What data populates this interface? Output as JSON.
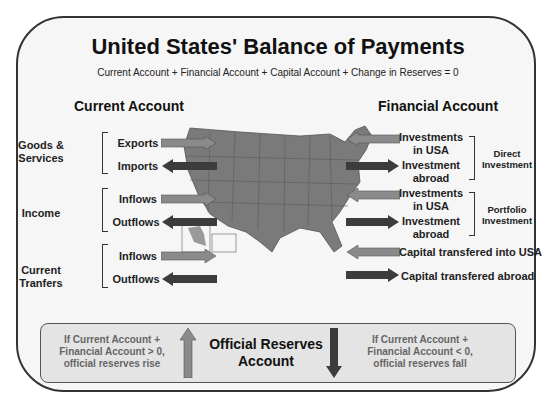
{
  "title": "United States' Balance of Payments",
  "subtitle": "Current Account + Financial Account + Capital Account + Change in Reserves = 0",
  "current_account": {
    "heading": "Current Account",
    "groups": [
      {
        "label_line1": "Goods &",
        "label_line2": "Services",
        "items": [
          {
            "label": "Exports",
            "direction": "in"
          },
          {
            "label": "Imports",
            "direction": "out"
          }
        ]
      },
      {
        "label_line1": "Income",
        "label_line2": "",
        "items": [
          {
            "label": "Inflows",
            "direction": "in"
          },
          {
            "label": "Outflows",
            "direction": "out"
          }
        ]
      },
      {
        "label_line1": "Current",
        "label_line2": "Tranfers",
        "items": [
          {
            "label": "Inflows",
            "direction": "in"
          },
          {
            "label": "Outflows",
            "direction": "out"
          }
        ]
      }
    ]
  },
  "financial_account": {
    "heading": "Financial Account",
    "groups": [
      {
        "label_line1": "Direct",
        "label_line2": "Investment",
        "items": [
          {
            "line1": "Investments",
            "line2": "in USA",
            "direction": "in"
          },
          {
            "line1": "Investment",
            "line2": "abroad",
            "direction": "out"
          }
        ]
      },
      {
        "label_line1": "Portfolio",
        "label_line2": "Investment",
        "items": [
          {
            "line1": "Investments",
            "line2": "in USA",
            "direction": "in"
          },
          {
            "line1": "Investment",
            "line2": "abroad",
            "direction": "out"
          }
        ]
      }
    ],
    "capital": [
      {
        "label": "Capital transfered into USA",
        "direction": "in"
      },
      {
        "label": "Capital transfered abroad",
        "direction": "out"
      }
    ]
  },
  "reserves": {
    "left_line1": "If Current Account +",
    "left_line2": "Financial Account > 0,",
    "left_line3": "official reserves rise",
    "center_line1": "Official Reserves",
    "center_line2": "Account",
    "right_line1": "If Current Account +",
    "right_line2": "Financial Account < 0,",
    "right_line3": "official reserves fall"
  },
  "colors": {
    "inflow_arrow": "#8a8a8a",
    "outflow_arrow": "#3c3c3c",
    "map_fill": "#7a7a7a",
    "frame_bg": "#f6f6f6",
    "reserves_bg": "#e4e4e4"
  }
}
